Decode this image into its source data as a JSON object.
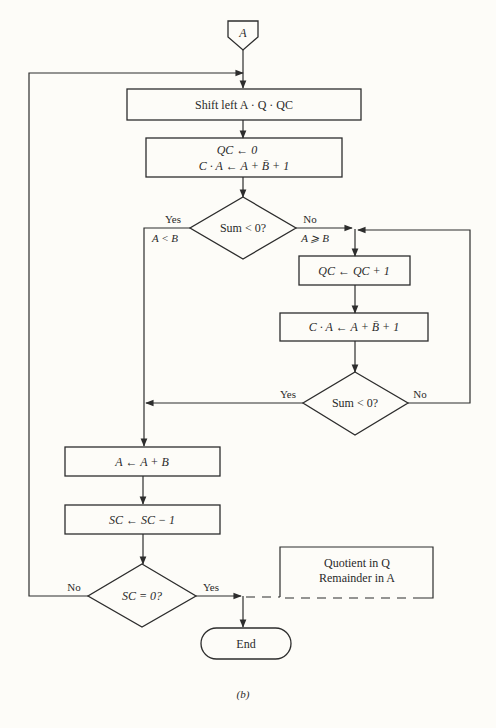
{
  "figure": {
    "caption": "(b)"
  },
  "nodes": {
    "start": {
      "label": "A",
      "type": "off-page-connector"
    },
    "shift": {
      "label": "Shift left A · Q · QC",
      "type": "process"
    },
    "init_line1": {
      "label": "QC ← 0",
      "type": "process"
    },
    "init_line2": {
      "label": "C · A ← A + B̄ + 1",
      "type": "process"
    },
    "decision1": {
      "label": "Sum < 0?",
      "type": "decision"
    },
    "qc_inc": {
      "label": "QC ← QC + 1",
      "type": "process"
    },
    "sub_again": {
      "label": "C · A ← A + B̄ + 1",
      "type": "process"
    },
    "decision2": {
      "label": "Sum < 0?",
      "type": "decision"
    },
    "restore": {
      "label": "A ← A + B",
      "type": "process"
    },
    "sc_dec": {
      "label": "SC ← SC − 1",
      "type": "process"
    },
    "decision3": {
      "label": "SC = 0?",
      "type": "decision"
    },
    "end": {
      "label": "End",
      "type": "terminator"
    },
    "annotation_line1": {
      "label": "Quotient in Q",
      "type": "annotation"
    },
    "annotation_line2": {
      "label": "Remainder in A",
      "type": "annotation"
    }
  },
  "edges": {
    "d1_yes": "Yes",
    "d1_yes_cond": "A < B",
    "d1_no": "No",
    "d1_no_cond": "A ⩾ B",
    "d2_yes": "Yes",
    "d2_no": "No",
    "d3_no": "No",
    "d3_yes": "Yes"
  },
  "colors": {
    "line": "#2d2d2d",
    "text": "#2a2a2a",
    "background": "#fdfcf8"
  }
}
